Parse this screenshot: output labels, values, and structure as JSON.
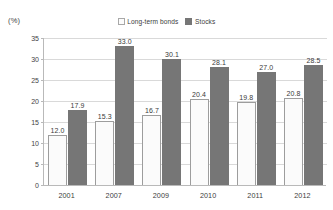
{
  "units_label": "(%)",
  "legend": {
    "position": "top-center",
    "items": [
      {
        "label": "Long-term bonds",
        "swatch": "bonds",
        "color": "#fcfcfc"
      },
      {
        "label": "Stocks",
        "swatch": "stocks",
        "color": "#767676"
      }
    ]
  },
  "chart_data": {
    "type": "bar",
    "title": "",
    "subtitle": "",
    "xlabel": "",
    "ylabel": "(%)",
    "ylim": [
      0,
      35
    ],
    "ytick_step": 5,
    "yticks": [
      "35",
      "30",
      "25",
      "20",
      "15",
      "10",
      "5",
      "0"
    ],
    "grid": true,
    "legend_position": "top-center",
    "categories": [
      "2001",
      "2007",
      "2009",
      "2010",
      "2011",
      "2012"
    ],
    "series": [
      {
        "name": "Long-term bonds",
        "color": "#fcfcfc",
        "values": [
          12.0,
          15.3,
          16.7,
          20.4,
          19.8,
          20.8
        ],
        "labels": [
          "12.0",
          "15.3",
          "16.7",
          "20.4",
          "19.8",
          "20.8"
        ]
      },
      {
        "name": "Stocks",
        "color": "#767676",
        "values": [
          17.9,
          33.0,
          30.1,
          28.1,
          27.0,
          28.5
        ],
        "labels": [
          "17.9",
          "33.0",
          "30.1",
          "28.1",
          "27.0",
          "28.5"
        ]
      }
    ]
  }
}
